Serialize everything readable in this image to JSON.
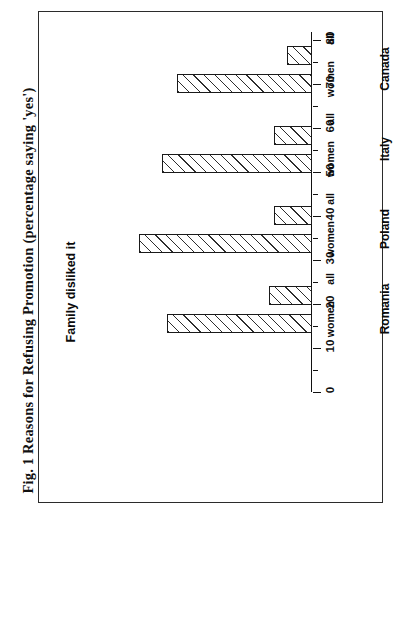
{
  "figure": {
    "caption": "Fig. 1 Reasons for Refusing Promotion (percentage saying 'yes')",
    "subtitle": "Family disliked it"
  },
  "axis": {
    "tick_labels": [
      "0",
      "10",
      "20",
      "30",
      "40",
      "50",
      "60",
      "70",
      "80"
    ],
    "minor_tick_step": 5
  },
  "series_labels": {
    "all": "all",
    "women": "women"
  },
  "groups": [
    {
      "label": "Canada",
      "all": 8,
      "women": 43
    },
    {
      "label": "Italy",
      "all": 12,
      "women": 47.5
    },
    {
      "label": "Poland",
      "all": 12,
      "women": 55
    },
    {
      "label": "Romania",
      "all": 13.5,
      "women": 46
    }
  ],
  "chart_data": {
    "type": "bar",
    "title": "Fig. 1 Reasons for Refusing Promotion (percentage saying 'yes')",
    "subtitle": "Family disliked it",
    "orientation": "horizontal",
    "categories": [
      "Canada",
      "Italy",
      "Poland",
      "Romania"
    ],
    "series": [
      {
        "name": "all",
        "values": [
          8,
          12,
          12,
          13.5
        ]
      },
      {
        "name": "women",
        "values": [
          43,
          47.5,
          55,
          46
        ]
      }
    ],
    "xlabel": "",
    "ylabel": "",
    "xlim": [
      0,
      80
    ],
    "ylim": [
      0,
      80
    ],
    "tick_values": [
      0,
      10,
      20,
      30,
      40,
      50,
      60,
      70,
      80
    ],
    "minor_tick_step": 5,
    "grid": false,
    "legend": "none",
    "bar_fill": "diagonal-hatch",
    "colors": {
      "line": "#111111",
      "fill": "#ffffff",
      "hatch": "#2d2d2d"
    }
  }
}
